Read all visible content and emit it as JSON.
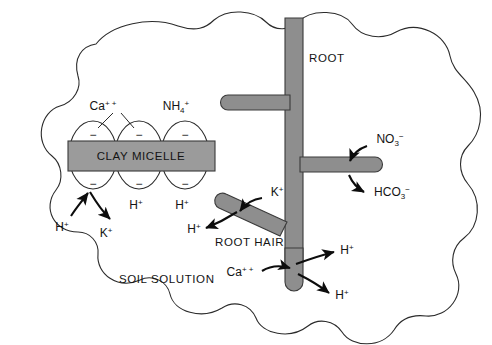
{
  "diagram": {
    "colors": {
      "root_fill": "#8e8e8e",
      "root_stroke": "#3a3a3a",
      "micelle_fill": "#9b9b9b",
      "micelle_stroke": "#3a3a3a",
      "ellipse_fill": "#ffffff",
      "ellipse_stroke": "#2b2b2b",
      "outline_stroke": "#2b2b2b",
      "arrow_color": "#0d0d0d",
      "text_color": "#141414",
      "background": "#ffffff"
    },
    "labels": {
      "root": "ROOT",
      "root_hair": "ROOT HAIR",
      "clay_micelle": "CLAY MICELLE",
      "soil_solution": "SOIL SOLUTION"
    },
    "micelle": {
      "charge_sign": "−",
      "charge_count": 6,
      "top_ions": [
        {
          "base": "Ca",
          "sup": "+ +",
          "sub": ""
        },
        {
          "base": "NH",
          "sup": "+",
          "sub": "4"
        }
      ],
      "bottom_ions": [
        {
          "base": "H",
          "sup": "+",
          "sub": ""
        },
        {
          "base": "H",
          "sup": "+",
          "sub": ""
        }
      ]
    },
    "exchange_arrows": [
      {
        "id": "h-into-micelle",
        "base": "H",
        "sup": "+",
        "sub": "",
        "direction": "in",
        "target": "clay-micelle"
      },
      {
        "id": "k-out-of-micelle",
        "base": "K",
        "sup": "+",
        "sub": "",
        "direction": "out",
        "target": "clay-micelle"
      },
      {
        "id": "k-into-root-hair",
        "base": "K",
        "sup": "+",
        "sub": "",
        "direction": "in",
        "target": "root-hair"
      },
      {
        "id": "h-out-of-root-hair",
        "base": "H",
        "sup": "+",
        "sub": "",
        "direction": "out",
        "target": "root-hair"
      },
      {
        "id": "no3-into-root",
        "base": "NO",
        "sup": "−",
        "sub": "3",
        "direction": "in",
        "target": "root-branch-right"
      },
      {
        "id": "hco3-out-of-root",
        "base": "HCO",
        "sup": "−",
        "sub": "3",
        "direction": "out",
        "target": "root-branch-right"
      },
      {
        "id": "ca-into-root-tip",
        "base": "Ca",
        "sup": "+ +",
        "sub": "",
        "direction": "in",
        "target": "root-tip"
      },
      {
        "id": "h-out-root-tip-upper",
        "base": "H",
        "sup": "+",
        "sub": "",
        "direction": "out",
        "target": "root-tip"
      },
      {
        "id": "h-out-root-tip-lower",
        "base": "H",
        "sup": "+",
        "sub": "",
        "direction": "out",
        "target": "root-tip"
      }
    ]
  }
}
